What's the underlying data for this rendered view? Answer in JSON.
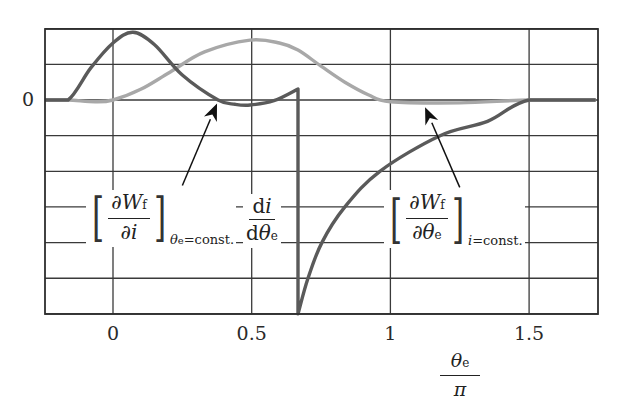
{
  "chart_data": {
    "type": "line",
    "title": "",
    "xlabel": "θe / π",
    "ylabel": "",
    "xlim": [
      -0.245,
      1.74
    ],
    "ylim_grid_units": [
      -6,
      2
    ],
    "grid": true,
    "x_ticks": [
      {
        "value": 0,
        "label": "0"
      },
      {
        "value": 0.5,
        "label": "0.5"
      },
      {
        "value": 1,
        "label": "1"
      },
      {
        "value": 1.5,
        "label": "1.5"
      }
    ],
    "y_ticks": [
      {
        "value": 0,
        "label": "0"
      }
    ],
    "series": [
      {
        "name": "[∂Wf/∂i] θe=const. and di/dθe (dark curve)",
        "color": "#5a5a5a",
        "x": [
          -0.245,
          -0.162,
          -0.08,
          0.0,
          0.072,
          0.15,
          0.25,
          0.379,
          0.44,
          0.494,
          0.58,
          0.667,
          0.667,
          0.703,
          0.753,
          0.836,
          0.962,
          1.179,
          1.35,
          1.5,
          1.74
        ],
        "values": [
          0,
          0,
          0.9,
          1.6,
          1.9,
          1.55,
          0.7,
          0,
          -0.12,
          -0.14,
          -0.02,
          0.31,
          -6,
          -5,
          -4,
          -3,
          -2,
          -1,
          -0.6,
          0,
          0
        ]
      },
      {
        "name": "[∂Wf/∂θe] i=const. (light curve)",
        "color": "#a8a8a8",
        "x": [
          -0.245,
          -0.162,
          -0.065,
          0.0,
          0.1,
          0.205,
          0.33,
          0.494,
          0.6,
          0.667,
          0.75,
          0.836,
          0.92,
          1.0,
          1.25,
          1.5,
          1.74
        ],
        "values": [
          0,
          0,
          -0.05,
          0,
          0.3,
          0.78,
          1.35,
          1.68,
          1.6,
          1.4,
          0.95,
          0.5,
          0.15,
          -0.05,
          -0.08,
          0,
          0
        ]
      }
    ],
    "annotations": [
      {
        "id": "ann1",
        "label": "[∂Wf/∂i] θe=const.",
        "arrow_from": [
          0.25,
          -2.4
        ],
        "arrow_to": [
          0.375,
          -0.1
        ]
      },
      {
        "id": "ann2",
        "label": "di/dθe"
      },
      {
        "id": "ann3",
        "label": "[∂Wf/∂θe] i=const.",
        "arrow_from": [
          1.25,
          -2.45
        ],
        "arrow_to": [
          1.125,
          -0.2
        ]
      }
    ]
  },
  "labels": {
    "zero": "0",
    "ann1": {
      "num_d": "∂",
      "num_v": "W",
      "num_sub": "f",
      "den_d": "∂",
      "den_v": "i",
      "sub_v": "θ",
      "sub_s": "e",
      "sub_rest": "=const."
    },
    "ann2": {
      "num": "d",
      "num_v": "i",
      "den": "d",
      "den_v": "θ",
      "den_s": "e"
    },
    "ann3": {
      "num_d": "∂",
      "num_v": "W",
      "num_sub": "f",
      "den_d": "∂",
      "den_v": "θ",
      "den_s": "e",
      "sub_v": "i",
      "sub_rest": "=const."
    },
    "xlabel_num": "θ",
    "xlabel_num_sub": "e",
    "xlabel_den": "π",
    "bracket_l": "[",
    "bracket_r": "]"
  },
  "style": {
    "grid_color": "#3a3a3a",
    "frame_color": "#2e2e2e"
  }
}
